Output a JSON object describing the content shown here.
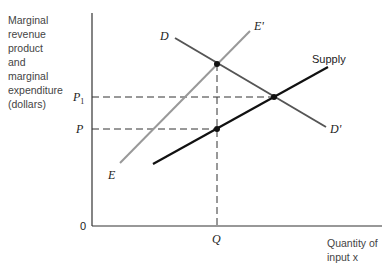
{
  "diagram": {
    "y_axis_label": "Marginal\nrevenue\nproduct\nand\nmarginal\nexpenditure\n(dollars)",
    "x_axis_label": "Quantity of\ninput x",
    "origin_label": "0",
    "y_ticks": [
      {
        "label": "P",
        "sub": "1",
        "y": 97
      },
      {
        "label": "P",
        "sub": "",
        "y": 129
      }
    ],
    "x_ticks": [
      {
        "label": "Q",
        "x": 217
      }
    ],
    "curves": [
      {
        "name": "D-D'",
        "start_label": "D",
        "end_label": "D'",
        "color": "#555555"
      },
      {
        "name": "E-E'",
        "start_label": "E",
        "end_label": "E'",
        "color": "#999999"
      },
      {
        "name": "Supply",
        "end_label": "Supply",
        "color": "#111111"
      }
    ],
    "points": [
      {
        "name": "D-E' intersection",
        "x": 217,
        "y": 64
      },
      {
        "name": "Supply-D intersection",
        "x": 274,
        "y": 97
      },
      {
        "name": "Supply at Q",
        "x": 217,
        "y": 129
      }
    ]
  }
}
